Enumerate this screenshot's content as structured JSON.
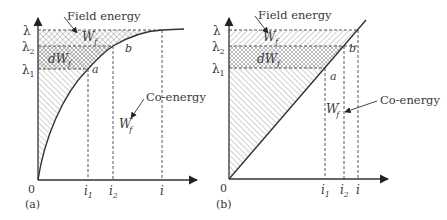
{
  "figure": {
    "panels": [
      {
        "id": "a",
        "caption": "(a)",
        "curve_type": "saturating",
        "origin_label": "0",
        "y_ticks": [
          {
            "name": "lambda",
            "base": "λ",
            "sub": ""
          },
          {
            "name": "lambda2",
            "base": "λ",
            "sub": "2"
          },
          {
            "name": "lambda1",
            "base": "λ",
            "sub": "1"
          }
        ],
        "x_ticks": [
          {
            "name": "i1",
            "base": "i",
            "sub": "1"
          },
          {
            "name": "i2",
            "base": "i",
            "sub": "2"
          },
          {
            "name": "i",
            "base": "i",
            "sub": ""
          }
        ],
        "points": {
          "a": "a",
          "b": "b"
        },
        "field_energy_label": "Field energy",
        "coenergy_label": "Co-energy",
        "wf_base": "W",
        "wf_sub": "f",
        "dwf_base": "dW",
        "dwf_sub": "f",
        "wf_prime_base": "W",
        "wf_prime_sup": "′",
        "wf_prime_sub": "f"
      },
      {
        "id": "b",
        "caption": "(b)",
        "curve_type": "linear",
        "origin_label": "0",
        "y_ticks": [
          {
            "name": "lambda",
            "base": "λ",
            "sub": ""
          },
          {
            "name": "lambda2",
            "base": "λ",
            "sub": "2"
          },
          {
            "name": "lambda1",
            "base": "λ",
            "sub": "1"
          }
        ],
        "x_ticks": [
          {
            "name": "i1",
            "base": "i",
            "sub": "1"
          },
          {
            "name": "i2",
            "base": "i",
            "sub": "2"
          },
          {
            "name": "i",
            "base": "i",
            "sub": ""
          }
        ],
        "points": {
          "a": "a",
          "b": "b"
        },
        "field_energy_label": "Field energy",
        "coenergy_label": "Co-energy",
        "wf_base": "W",
        "wf_sub": "f",
        "dwf_base": "dW",
        "dwf_sub": "f",
        "wf_prime_base": "W",
        "wf_prime_sup": "′",
        "wf_prime_sub": "f"
      }
    ]
  }
}
